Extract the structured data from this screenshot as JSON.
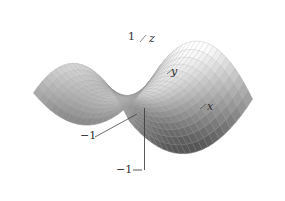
{
  "figure": {
    "title": "",
    "background_color": "#ffffff",
    "caption": ""
  },
  "chart_data": {
    "type": "surface3d",
    "title": "",
    "subtitle": "",
    "xlabel": "x",
    "ylabel": "y",
    "zlabel": "z",
    "surface_equation": "z = x^2 - y^2",
    "surface_name": "hyperbolic paraboloid (saddle)",
    "xlim": [
      -1,
      1
    ],
    "ylim": [
      -1,
      1
    ],
    "zlim": [
      -1,
      1
    ],
    "grid": true,
    "legend": "none",
    "mesh_divisions_u": 22,
    "mesh_divisions_v": 22,
    "mesh_line_color": "#9a9a9a",
    "surface_top_color": "#fdfdfd",
    "surface_bottom_color": "#6f6f6f",
    "axis_line_color": "#3a3a3a",
    "projection": {
      "azimuth_deg": 38,
      "elevation_deg": 22,
      "scale": 78,
      "origin_x": 143,
      "origin_y": 96,
      "z_scale": 46
    },
    "annotations": [
      {
        "id": "z-axis-label",
        "text": "z",
        "x": 149,
        "y": 33,
        "italic": true
      },
      {
        "id": "y-axis-label",
        "text": "y",
        "x": 171,
        "y": 66,
        "italic": true
      },
      {
        "id": "x-axis-label",
        "text": "x",
        "x": 207,
        "y": 101,
        "italic": true
      },
      {
        "id": "z-top-tick-label",
        "text": "1",
        "x": 128,
        "y": 31,
        "italic": false
      },
      {
        "id": "left-tick-label",
        "text": "−1",
        "x": 80,
        "y": 130,
        "italic": false
      },
      {
        "id": "bottom-tick-label",
        "text": "−1",
        "x": 116,
        "y": 164,
        "italic": false
      }
    ],
    "axis_ticks": {
      "z_top": 1,
      "left": -1,
      "bottom": -1
    }
  },
  "labels": {
    "x": "x",
    "y": "y",
    "z": "z",
    "tick_z_top": "1",
    "tick_left": "−1",
    "tick_bottom": "−1"
  }
}
